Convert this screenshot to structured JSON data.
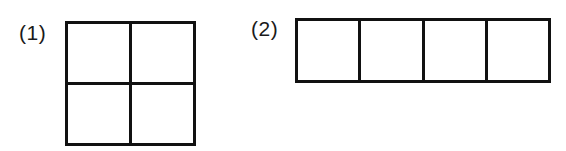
{
  "page": {
    "background_color": "#ffffff",
    "line_color": "#111111",
    "label_color": "#1a1a1a",
    "width": 566,
    "height": 151
  },
  "figures": [
    {
      "label": "(1)",
      "name": "two-by-two-square-grid",
      "rows": 2,
      "columns": 4,
      "cell_count": 4,
      "shape": "square",
      "cells": [
        "",
        "",
        "",
        ""
      ]
    },
    {
      "label": "(2)",
      "name": "one-by-four-rectangle-strip",
      "rows": 1,
      "columns": 4,
      "cell_count": 4,
      "shape": "horizontal-strip",
      "cells": [
        "",
        "",
        "",
        ""
      ]
    }
  ]
}
